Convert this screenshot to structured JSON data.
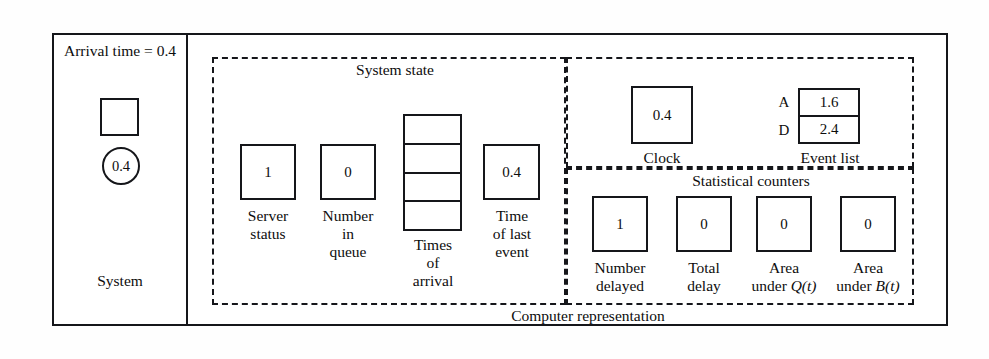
{
  "figure": {
    "left_panel": {
      "title": "Arrival\ntime = 0.4",
      "entity_value": "0.4",
      "footer_label": "System"
    },
    "right_panel": {
      "footer_label": "Computer representation",
      "regions": {
        "system_state": {
          "label": "System state",
          "items": [
            {
              "name": "server-status",
              "value": "1",
              "label": "Server\nstatus"
            },
            {
              "name": "number-in-queue",
              "value": "0",
              "label": "Number\nin\nqueue"
            },
            {
              "name": "times-of-arrival",
              "value": "",
              "label": "Times\nof\narrival",
              "slots": [
                "",
                "",
                "",
                ""
              ]
            },
            {
              "name": "time-of-last-event",
              "value": "0.4",
              "label": "Time\nof last\nevent"
            }
          ]
        },
        "clock_and_event_list": {
          "clock": {
            "value": "0.4",
            "label": "Clock"
          },
          "event_list": {
            "label": "Event list",
            "rows": [
              {
                "key": "A",
                "value": "1.6"
              },
              {
                "key": "D",
                "value": "2.4"
              }
            ]
          }
        },
        "statistical_counters": {
          "label": "Statistical counters",
          "items": [
            {
              "name": "number-delayed",
              "value": "1",
              "label": "Number\ndelayed"
            },
            {
              "name": "total-delay",
              "value": "0",
              "label": "Total\ndelay"
            },
            {
              "name": "area-under-q",
              "value": "0",
              "label_prefix": "Area\nunder ",
              "label_math": "Q(t)"
            },
            {
              "name": "area-under-b",
              "value": "0",
              "label_prefix": "Area\nunder ",
              "label_math": "B(t)"
            }
          ]
        }
      }
    }
  },
  "colors": {
    "ink": "#15161a",
    "paper": "#ffffff"
  }
}
